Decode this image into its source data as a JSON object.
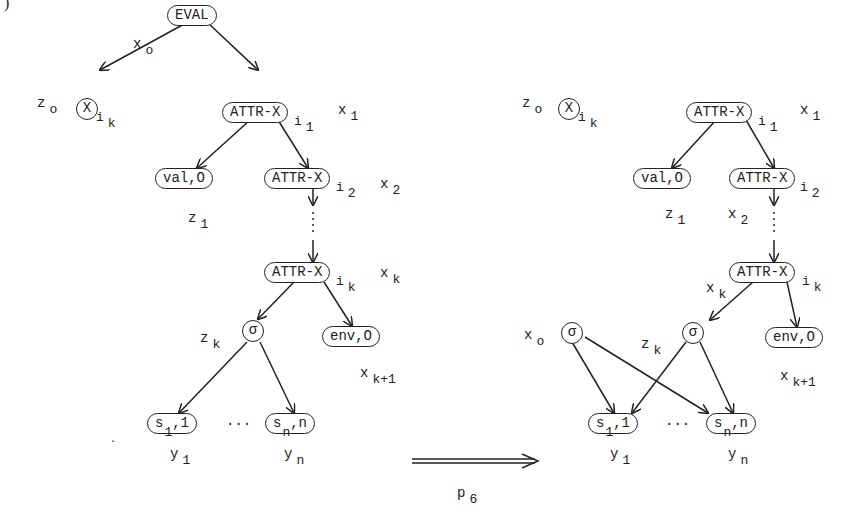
{
  "figure": {
    "corner_mark": ")",
    "transition": {
      "label": "p",
      "label_sub": "6"
    }
  },
  "left_graph": {
    "nodes": {
      "eval": "EVAL",
      "x_ik": {
        "text": "X",
        "sub": "i",
        "subsub": "k"
      },
      "attr1": {
        "text": "ATTR-X",
        "sub": "i",
        "subsub": "1"
      },
      "val0": "val,O",
      "attr2": {
        "text": "ATTR-X",
        "sub": "i",
        "subsub": "2"
      },
      "attrk": {
        "text": "ATTR-X",
        "sub": "i",
        "subsub": "k"
      },
      "sigma": "σ",
      "env0": "env,O",
      "s1": {
        "text": "s",
        "sub": "1",
        "tail": ",1"
      },
      "sn": {
        "text": "s",
        "sub": "n",
        "tail": ",n"
      },
      "ellipsis": "..."
    },
    "labels": {
      "x0": {
        "base": "x",
        "sub": "o"
      },
      "z0": {
        "base": "z",
        "sub": "o"
      },
      "x1": {
        "base": "x",
        "sub": "1"
      },
      "x2": {
        "base": "x",
        "sub": "2"
      },
      "z1": {
        "base": "z",
        "sub": "1"
      },
      "xk": {
        "base": "x",
        "sub": "k"
      },
      "zk": {
        "base": "z",
        "sub": "k"
      },
      "xk1": {
        "base": "x",
        "sub": "k+1"
      },
      "y1": {
        "base": "y",
        "sub": "1"
      },
      "yn": {
        "base": "y",
        "sub": "n"
      }
    }
  },
  "right_graph": {
    "nodes": {
      "x_ik": {
        "text": "X",
        "sub": "i",
        "subsub": "k"
      },
      "attr1": {
        "text": "ATTR-X",
        "sub": "i",
        "subsub": "1"
      },
      "val0": "val,O",
      "attr2": {
        "text": "ATTR-X",
        "sub": "i",
        "subsub": "2"
      },
      "attrk": {
        "text": "ATTR-X",
        "sub": "i",
        "subsub": "k"
      },
      "sigma0": "σ",
      "sigmak": "σ",
      "env0": "env,O",
      "s1": {
        "text": "s",
        "sub": "1",
        "tail": ",1"
      },
      "sn": {
        "text": "s",
        "sub": "n",
        "tail": ",n"
      },
      "ellipsis": "..."
    },
    "labels": {
      "z0": {
        "base": "z",
        "sub": "o"
      },
      "x1": {
        "base": "x",
        "sub": "1"
      },
      "z1": {
        "base": "z",
        "sub": "1"
      },
      "x2": {
        "base": "x",
        "sub": "2"
      },
      "xk": {
        "base": "x",
        "sub": "k"
      },
      "x0": {
        "base": "x",
        "sub": "o"
      },
      "zk": {
        "base": "z",
        "sub": "k"
      },
      "xk1": {
        "base": "x",
        "sub": "k+1"
      },
      "y1": {
        "base": "y",
        "sub": "1"
      },
      "yn": {
        "base": "y",
        "sub": "n"
      }
    }
  }
}
